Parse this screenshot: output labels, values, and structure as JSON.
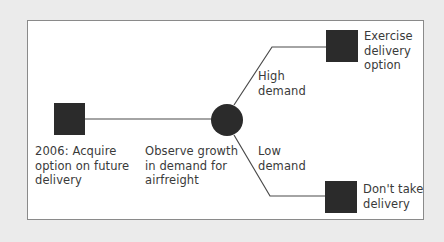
{
  "diagram": {
    "type": "decision-tree",
    "colors": {
      "background": "#ebebeb",
      "panel": "#ffffff",
      "node_fill": "#2b2b2b",
      "line": "#4a4a4a",
      "text": "#3a3a3a"
    },
    "nodes": {
      "start": {
        "shape": "square",
        "kind": "decision",
        "label": "2006: Acquire\noption on future\ndelivery"
      },
      "chance": {
        "shape": "circle",
        "kind": "chance",
        "label": "Observe growth\nin demand for\nairfreight"
      },
      "exercise": {
        "shape": "square",
        "kind": "decision",
        "label": "Exercise\ndelivery\noption"
      },
      "no_delivery": {
        "shape": "square",
        "kind": "decision",
        "label": "Don't take\ndelivery"
      }
    },
    "branches": {
      "high": {
        "label": "High\ndemand",
        "from": "chance",
        "to": "exercise"
      },
      "low": {
        "label": "Low\ndemand",
        "from": "chance",
        "to": "no_delivery"
      }
    }
  }
}
